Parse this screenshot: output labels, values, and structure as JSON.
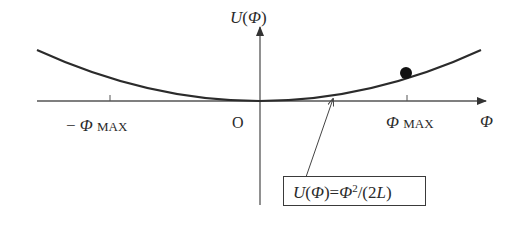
{
  "diagram": {
    "type": "potential-energy-parabola",
    "y_axis": {
      "label_func": "U",
      "label_arg": "Φ",
      "label": "U(Φ)"
    },
    "x_axis": {
      "label": "Φ"
    },
    "origin_label": "O",
    "ticks": [
      {
        "sign": "−",
        "symbol": "Φ",
        "subscript": "MAX",
        "label": "−Φ MAX",
        "x": 110
      },
      {
        "sign": "",
        "symbol": "Φ",
        "subscript": "MAX",
        "label": "Φ MAX",
        "x": 407
      }
    ],
    "curve": {
      "equation": "U(Φ) = Φ^2/(2L)",
      "vertex": [
        260,
        101
      ],
      "left_end": [
        37,
        50
      ],
      "right_end": [
        481,
        50
      ]
    },
    "ball": {
      "x": 406,
      "y": 73,
      "r": 6,
      "color": "#111111"
    },
    "annotation": {
      "lhs": "U(Φ)",
      "equals": "=",
      "base": "Φ",
      "exponent": "2",
      "rest": "/(2L)",
      "text": "U(Φ)=Φ²/(2L)"
    },
    "colors": {
      "line": "#2b2b2b",
      "axis": "#555555",
      "text": "#2a2a2a"
    }
  }
}
